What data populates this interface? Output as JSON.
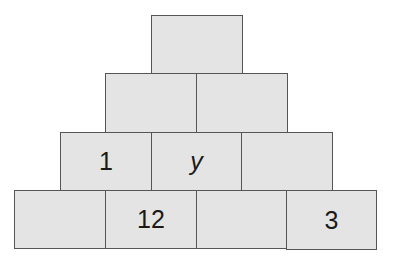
{
  "diagram": {
    "type": "number-pyramid",
    "colors": {
      "brick_fill": "#e4e4e4",
      "brick_border": "#555555",
      "text": "#1a1a1a"
    },
    "rows": [
      {
        "row": 1,
        "bricks": [
          {
            "label": ""
          }
        ]
      },
      {
        "row": 2,
        "bricks": [
          {
            "label": ""
          },
          {
            "label": ""
          }
        ]
      },
      {
        "row": 3,
        "bricks": [
          {
            "label": "1"
          },
          {
            "label": "y"
          },
          {
            "label": ""
          }
        ]
      },
      {
        "row": 4,
        "bricks": [
          {
            "label": ""
          },
          {
            "label": "12"
          },
          {
            "label": ""
          },
          {
            "label": "3"
          }
        ]
      }
    ]
  }
}
